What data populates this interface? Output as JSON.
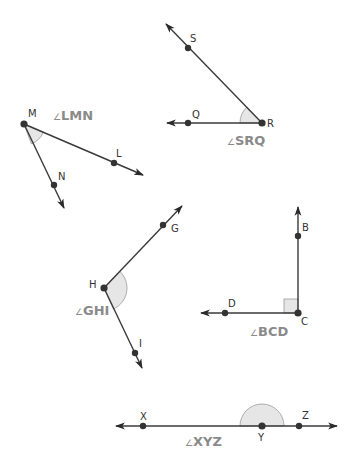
{
  "colors": {
    "ray": "#3a3a3a",
    "point": "#333333",
    "angle_fill": "#e6e6e6",
    "angle_label": "#8a8a8a"
  },
  "angles": [
    {
      "id": "LMN",
      "label": "LMN",
      "symbol": "∠",
      "type": "acute",
      "vertex": {
        "name": "M",
        "x": 24,
        "y": 124
      },
      "points": [
        {
          "name": "L",
          "x": 114,
          "y": 163
        },
        {
          "name": "N",
          "x": 54,
          "y": 185
        }
      ]
    },
    {
      "id": "SRQ",
      "label": "SRQ",
      "symbol": "∠",
      "type": "acute",
      "vertex": {
        "name": "R",
        "x": 262,
        "y": 123
      },
      "points": [
        {
          "name": "S",
          "x": 188,
          "y": 48
        },
        {
          "name": "Q",
          "x": 188,
          "y": 123
        }
      ]
    },
    {
      "id": "GHI",
      "label": "GHI",
      "symbol": "∠",
      "type": "obtuse",
      "vertex": {
        "name": "H",
        "x": 104,
        "y": 288
      },
      "points": [
        {
          "name": "G",
          "x": 163,
          "y": 225
        },
        {
          "name": "I",
          "x": 135,
          "y": 353
        }
      ]
    },
    {
      "id": "BCD",
      "label": "BCD",
      "symbol": "∠",
      "type": "right",
      "vertex": {
        "name": "C",
        "x": 298,
        "y": 313
      },
      "points": [
        {
          "name": "B",
          "x": 298,
          "y": 236
        },
        {
          "name": "D",
          "x": 225,
          "y": 313
        }
      ]
    },
    {
      "id": "XYZ",
      "label": "XYZ",
      "symbol": "∠",
      "type": "straight",
      "vertex": {
        "name": "Y",
        "x": 262,
        "y": 426
      },
      "points": [
        {
          "name": "X",
          "x": 143,
          "y": 426
        },
        {
          "name": "Z",
          "x": 299,
          "y": 426
        }
      ]
    }
  ],
  "point_labels": {
    "M": "M",
    "L": "L",
    "N": "N",
    "S": "S",
    "R": "R",
    "Q": "Q",
    "G": "G",
    "H": "H",
    "I": "I",
    "B": "B",
    "C": "C",
    "D": "D",
    "X": "X",
    "Y": "Y",
    "Z": "Z"
  },
  "angle_labels": {
    "symbol": "∠",
    "LMN": "LMN",
    "SRQ": "SRQ",
    "GHI": "GHI",
    "BCD": "BCD",
    "XYZ": "XYZ"
  }
}
